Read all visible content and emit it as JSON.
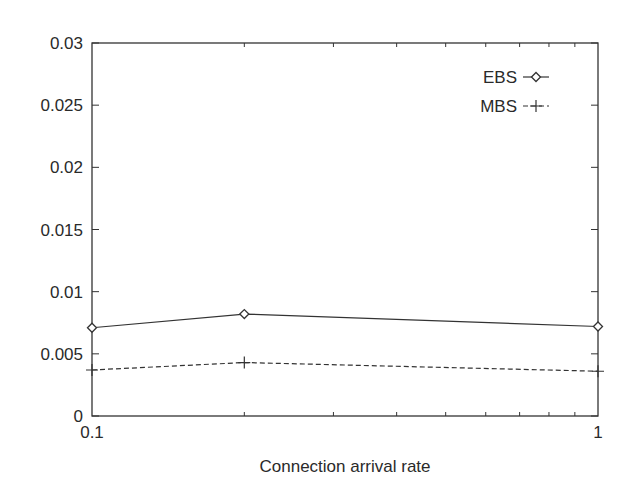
{
  "chart_data": {
    "type": "line",
    "title": "",
    "xlabel": "Connection arrival rate",
    "ylabel": "",
    "xscale": "log",
    "xlim": [
      0.1,
      1
    ],
    "ylim": [
      0,
      0.03
    ],
    "x_tick_labels": [
      "0.1",
      "1"
    ],
    "y_tick_labels": [
      "0",
      "0.005",
      "0.01",
      "0.015",
      "0.02",
      "0.025",
      "0.03"
    ],
    "x": [
      0.1,
      0.2,
      1
    ],
    "series": [
      {
        "name": "EBS",
        "values": [
          0.0071,
          0.0082,
          0.0072
        ],
        "line_style": "solid",
        "marker": "diamond"
      },
      {
        "name": "MBS",
        "values": [
          0.0037,
          0.0043,
          0.0036
        ],
        "line_style": "dashed",
        "marker": "plus"
      }
    ],
    "legend_position": "upper right",
    "grid": false
  },
  "colors": {
    "axis": "#333333",
    "series_line": "#333333",
    "background": "#ffffff"
  }
}
